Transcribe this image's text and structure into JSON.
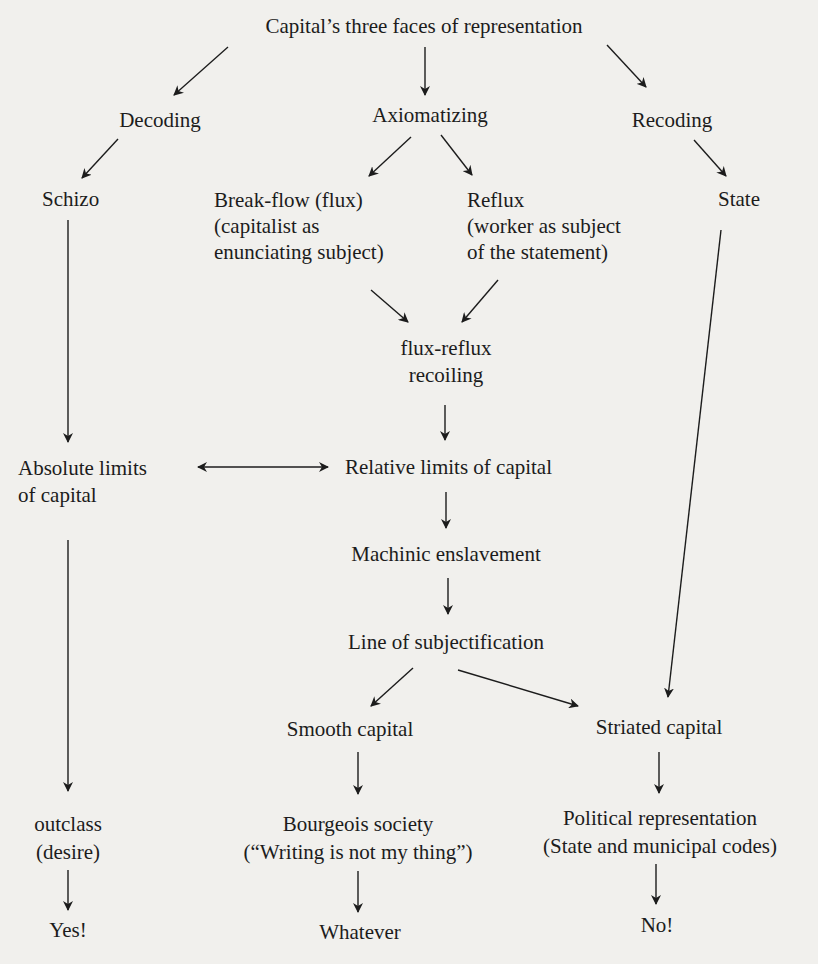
{
  "diagram": {
    "nodes": {
      "root": {
        "lines": [
          "Capital’s three faces of representation"
        ]
      },
      "decoding": {
        "lines": [
          "Decoding"
        ]
      },
      "axiomatizing": {
        "lines": [
          "Axiomatizing"
        ]
      },
      "recoding": {
        "lines": [
          "Recoding"
        ]
      },
      "schizo": {
        "lines": [
          "Schizo"
        ]
      },
      "breakflow": {
        "lines": [
          "Break-flow (flux)",
          "(capitalist as",
          "enunciating subject)"
        ]
      },
      "reflux": {
        "lines": [
          "Reflux",
          "(worker as subject",
          "of the statement)"
        ]
      },
      "state": {
        "lines": [
          "State"
        ]
      },
      "fluxreflux": {
        "lines": [
          "flux-reflux",
          "recoiling"
        ]
      },
      "absolute": {
        "lines": [
          "Absolute limits",
          "of capital"
        ]
      },
      "relative": {
        "lines": [
          "Relative limits of capital"
        ]
      },
      "machinic": {
        "lines": [
          "Machinic enslavement"
        ]
      },
      "subjectification": {
        "lines": [
          "Line of subjectification"
        ]
      },
      "smooth": {
        "lines": [
          "Smooth capital"
        ]
      },
      "striated": {
        "lines": [
          "Striated capital"
        ]
      },
      "outclass": {
        "lines": [
          "outclass",
          "(desire)"
        ]
      },
      "bourgeois": {
        "lines": [
          "Bourgeois society",
          "(“Writing is not my thing”)"
        ]
      },
      "political": {
        "lines": [
          "Political representation",
          "(State and municipal codes)"
        ]
      },
      "yes": {
        "lines": [
          "Yes!"
        ]
      },
      "whatever": {
        "lines": [
          "Whatever"
        ]
      },
      "no": {
        "lines": [
          "No!"
        ]
      }
    },
    "edges": [
      {
        "from": "root",
        "to": "decoding",
        "type": "arrow"
      },
      {
        "from": "root",
        "to": "axiomatizing",
        "type": "arrow"
      },
      {
        "from": "root",
        "to": "recoding",
        "type": "arrow"
      },
      {
        "from": "decoding",
        "to": "schizo",
        "type": "arrow"
      },
      {
        "from": "axiomatizing",
        "to": "breakflow",
        "type": "arrow"
      },
      {
        "from": "axiomatizing",
        "to": "reflux",
        "type": "arrow"
      },
      {
        "from": "recoding",
        "to": "state",
        "type": "arrow"
      },
      {
        "from": "breakflow",
        "to": "fluxreflux",
        "type": "arrow"
      },
      {
        "from": "reflux",
        "to": "fluxreflux",
        "type": "arrow"
      },
      {
        "from": "schizo",
        "to": "absolute",
        "type": "arrow"
      },
      {
        "from": "fluxreflux",
        "to": "relative",
        "type": "arrow"
      },
      {
        "from": "absolute",
        "to": "relative",
        "type": "double-arrow"
      },
      {
        "from": "relative",
        "to": "machinic",
        "type": "arrow"
      },
      {
        "from": "machinic",
        "to": "subjectification",
        "type": "arrow"
      },
      {
        "from": "state",
        "to": "striated",
        "type": "arrow"
      },
      {
        "from": "subjectification",
        "to": "smooth",
        "type": "arrow"
      },
      {
        "from": "subjectification",
        "to": "striated",
        "type": "arrow"
      },
      {
        "from": "absolute",
        "to": "outclass",
        "type": "arrow"
      },
      {
        "from": "smooth",
        "to": "bourgeois",
        "type": "arrow"
      },
      {
        "from": "striated",
        "to": "political",
        "type": "arrow"
      },
      {
        "from": "outclass",
        "to": "yes",
        "type": "arrow"
      },
      {
        "from": "bourgeois",
        "to": "whatever",
        "type": "arrow"
      },
      {
        "from": "political",
        "to": "no",
        "type": "arrow"
      }
    ]
  },
  "colors": {
    "background": "#f1f0ed",
    "ink": "#1c1c1c"
  }
}
